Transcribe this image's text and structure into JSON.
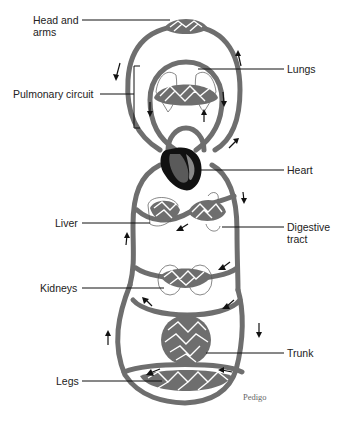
{
  "diagram": {
    "labels": {
      "head_arms": "Head and\narms",
      "head_arms_line1": "Head and",
      "head_arms_line2": "arms",
      "pulmonary": "Pulmonary circuit",
      "lungs": "Lungs",
      "heart": "Heart",
      "liver": "Liver",
      "digestive_line1": "Digestive",
      "digestive_line2": "tract",
      "kidneys": "Kidneys",
      "trunk": "Trunk",
      "legs": "Legs"
    },
    "credit": "Pedigo",
    "colors": {
      "vessel": "#6e6e6e",
      "heart_outer": "#111111",
      "heart_inner": "#5a5a5a",
      "text": "#222222",
      "background": "#ffffff"
    },
    "nodes": [
      "Head and arms",
      "Lungs",
      "Heart",
      "Liver",
      "Digestive tract",
      "Kidneys",
      "Trunk",
      "Legs"
    ],
    "edges": [
      {
        "from": "Heart",
        "to": "Lungs",
        "circuit": "pulmonary"
      },
      {
        "from": "Lungs",
        "to": "Heart",
        "circuit": "pulmonary"
      },
      {
        "from": "Heart",
        "to": "Head and arms",
        "circuit": "systemic"
      },
      {
        "from": "Head and arms",
        "to": "Heart",
        "circuit": "systemic"
      },
      {
        "from": "Heart",
        "to": "Digestive tract",
        "circuit": "systemic"
      },
      {
        "from": "Digestive tract",
        "to": "Liver",
        "circuit": "hepatic portal"
      },
      {
        "from": "Liver",
        "to": "Heart",
        "circuit": "systemic"
      },
      {
        "from": "Heart",
        "to": "Kidneys",
        "circuit": "systemic"
      },
      {
        "from": "Heart",
        "to": "Trunk",
        "circuit": "systemic"
      },
      {
        "from": "Heart",
        "to": "Legs",
        "circuit": "systemic"
      }
    ]
  }
}
